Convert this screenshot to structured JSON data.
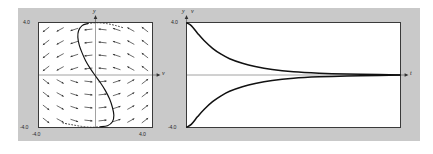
{
  "figure": {
    "background_color": "#c9c9c9",
    "plot_background": "#ffffff",
    "curve_color": "#111111",
    "axis_color": "#808080",
    "frame_color": "#3a3a3a"
  },
  "chart_data": [
    {
      "type": "scatter",
      "name": "phase-portrait",
      "title": "",
      "xlabel": "v",
      "ylabel": "y",
      "xlim": [
        -4.0,
        4.0
      ],
      "ylim": [
        -4.0,
        4.0
      ],
      "xticks": [
        "-4.0",
        "4.0"
      ],
      "yticks": [
        "-4.0",
        "4.0"
      ],
      "grid": false,
      "legend": "none",
      "annotations": [
        "direction field of arrows on an 8x8 grid",
        "single S-shaped solution trajectory"
      ],
      "vector_field": {
        "grid_nx": 8,
        "grid_ny": 8,
        "x_start": -3.5,
        "x_step": 1.0,
        "y_start": 3.5,
        "y_step": -1.0,
        "description": "arrows point predominantly horizontally toward the v-axis, flipping direction across y = 0"
      },
      "trajectory": {
        "name": "solution-curve",
        "points": [
          [
            -0.55,
            3.95
          ],
          [
            -0.95,
            3.8
          ],
          [
            -1.2,
            3.4
          ],
          [
            -1.25,
            2.9
          ],
          [
            -1.15,
            2.3
          ],
          [
            -0.95,
            1.7
          ],
          [
            -0.7,
            1.1
          ],
          [
            -0.4,
            0.55
          ],
          [
            -0.05,
            0.0
          ],
          [
            0.35,
            -0.6
          ],
          [
            0.7,
            -1.2
          ],
          [
            1.0,
            -1.85
          ],
          [
            1.2,
            -2.5
          ],
          [
            1.3,
            -3.1
          ],
          [
            1.2,
            -3.6
          ],
          [
            0.85,
            -3.9
          ],
          [
            0.35,
            -3.98
          ]
        ]
      },
      "dashed_curve": {
        "name": "nullcline-dashes",
        "description": "dotted arcs near the top and bottom of the trajectory"
      }
    },
    {
      "type": "line",
      "name": "time-series",
      "title": "",
      "xlabel": "t",
      "ylabel": "y v",
      "ylim": [
        -4.0,
        4.0
      ],
      "yticks": [
        "-4.0",
        "4.0"
      ],
      "grid": false,
      "legend": "none",
      "series": [
        {
          "name": "y",
          "description": "decays from +4.0 toward 0",
          "x": [
            0.0,
            0.02,
            0.05,
            0.08,
            0.12,
            0.16,
            0.2,
            0.26,
            0.32,
            0.4,
            0.5,
            0.62,
            0.75,
            0.9,
            1.0
          ],
          "values": [
            4.0,
            3.8,
            3.2,
            2.65,
            2.05,
            1.6,
            1.25,
            0.9,
            0.65,
            0.42,
            0.25,
            0.14,
            0.07,
            0.03,
            0.0
          ]
        },
        {
          "name": "v",
          "description": "decays from -4.0 toward 0",
          "x": [
            0.0,
            0.02,
            0.05,
            0.08,
            0.12,
            0.16,
            0.2,
            0.26,
            0.32,
            0.4,
            0.5,
            0.62,
            0.75,
            0.9,
            1.0
          ],
          "values": [
            -4.0,
            -3.8,
            -3.2,
            -2.65,
            -2.05,
            -1.6,
            -1.25,
            -0.9,
            -0.65,
            -0.42,
            -0.25,
            -0.14,
            -0.07,
            -0.03,
            0.0
          ]
        }
      ]
    }
  ],
  "phase_plot": {
    "axis_label_y": "y",
    "axis_label_v": "v",
    "tick_top": "4.0",
    "tick_bottom_left": "-4.0",
    "tick_x_left": "-4.0",
    "tick_x_right": "4.0"
  },
  "time_plot": {
    "axis_label_y": "y",
    "axis_label_v": "v",
    "axis_label_t": "t",
    "tick_top": "4.0",
    "tick_bottom": "-4.0"
  }
}
